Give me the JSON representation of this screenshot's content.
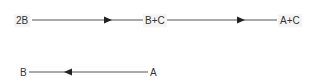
{
  "diagram": {
    "rows": [
      {
        "nodes": [
          {
            "id": "n1",
            "label": "2B"
          },
          {
            "id": "n2",
            "label": "B+C"
          },
          {
            "id": "n3",
            "label": "A+C"
          }
        ],
        "edges": [
          {
            "from": "2B",
            "to": "B+C",
            "direction": "right"
          },
          {
            "from": "B+C",
            "to": "A+C",
            "direction": "right"
          }
        ]
      },
      {
        "nodes": [
          {
            "id": "n4",
            "label": "B"
          },
          {
            "id": "n5",
            "label": "A"
          }
        ],
        "edges": [
          {
            "from": "A",
            "to": "B",
            "direction": "left"
          }
        ]
      }
    ],
    "colors": {
      "line": "#555555",
      "arrow": "#222222",
      "text": "#333333"
    }
  }
}
